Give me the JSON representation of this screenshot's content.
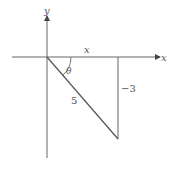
{
  "diagram": {
    "type": "right-triangle-on-axes",
    "axes": {
      "x_label": "x",
      "y_label": "y"
    },
    "triangle": {
      "horizontal_leg_label": "x",
      "vertical_leg_label": "−3",
      "hypotenuse_label": "5",
      "angle_label": "θ"
    },
    "colors": {
      "line": "#555555",
      "background": "#ffffff"
    }
  }
}
